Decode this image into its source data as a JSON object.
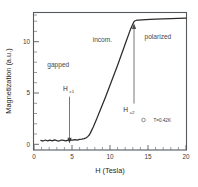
{
  "chart_data": {
    "type": "line",
    "title": "",
    "xlabel": "H (Tesla)",
    "ylabel": "Magnetization (a.u.)",
    "xlim": [
      0,
      20
    ],
    "ylim": [
      -1.0,
      13.6
    ],
    "xticks": [
      0,
      5,
      10,
      15,
      20
    ],
    "yticks": [
      0,
      5,
      10
    ],
    "xtick_labels": [
      "0",
      "5",
      "10",
      "15",
      "20"
    ],
    "ytick_labels": [
      "0",
      "5",
      "10"
    ],
    "grid": false,
    "legend": false,
    "series": [
      {
        "name": "Magnetization",
        "x": [
          0.9,
          1.2,
          1.5,
          1.8,
          2.1,
          2.4,
          2.7,
          3.0,
          3.3,
          3.6,
          3.9,
          4.2,
          4.5,
          4.8,
          5.1,
          5.4,
          5.7,
          6.0,
          6.3,
          6.6,
          6.9,
          7.1,
          7.3,
          7.5,
          7.8,
          8.2,
          8.6,
          9.0,
          9.4,
          9.8,
          10.2,
          10.6,
          11.0,
          11.4,
          11.8,
          12.2,
          12.6,
          12.9,
          13.1,
          13.25,
          13.5,
          13.8,
          14.2,
          14.7,
          15.3,
          16.0,
          17.0,
          18.0,
          19.0,
          20.0
        ],
        "y": [
          0.02,
          -0.05,
          0.06,
          -0.04,
          0.05,
          -0.03,
          0.07,
          0.0,
          -0.05,
          0.06,
          0.02,
          -0.04,
          0.05,
          0.08,
          0.04,
          0.1,
          0.06,
          0.12,
          0.15,
          0.2,
          0.3,
          0.45,
          0.62,
          0.95,
          1.45,
          2.2,
          3.0,
          3.8,
          4.6,
          5.45,
          6.3,
          7.15,
          8.0,
          8.9,
          9.8,
          10.7,
          11.6,
          12.2,
          12.55,
          12.7,
          12.78,
          12.8,
          12.82,
          12.85,
          12.88,
          12.9,
          12.92,
          12.95,
          12.97,
          13.0
        ]
      }
    ],
    "annotations": [
      {
        "name": "gapped",
        "text": "gapped",
        "x": 3.2,
        "y": 7.5
      },
      {
        "name": "incom",
        "text": "incom.",
        "x": 9.0,
        "y": 10.0
      },
      {
        "name": "polarized",
        "text": "polarized",
        "x": 16.3,
        "y": 10.3
      }
    ],
    "critical_fields": [
      {
        "name": "Hc1",
        "label": "H",
        "subscript": "c1",
        "value": 7.3,
        "label_y": 5.2,
        "arrow_from_y": 4.4,
        "arrow_to_y": 0.55,
        "direction": "down"
      },
      {
        "name": "Hc2",
        "label": "H",
        "subscript": "c2",
        "value": 13.2,
        "label_y": 3.1,
        "arrow_from_y": 4.0,
        "arrow_to_y": 12.6,
        "direction": "up"
      }
    ],
    "temperature_note": {
      "marker": "open-circle",
      "text": "T=0.42K",
      "x": 16.2,
      "y": 1.9
    }
  }
}
